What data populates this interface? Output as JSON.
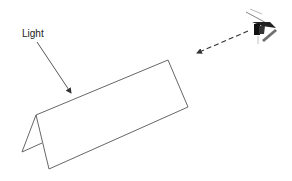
{
  "diagram": {
    "type": "illustration",
    "labels": {
      "light": "Light"
    },
    "elements": [
      {
        "name": "light-label",
        "text": "Light"
      },
      {
        "name": "light-arrow",
        "style": "solid",
        "direction": "toward card top face"
      },
      {
        "name": "folded-card",
        "shape": "tent-fold"
      },
      {
        "name": "view-arrow",
        "style": "dashed",
        "direction": "from eye toward card"
      },
      {
        "name": "eye-icon",
        "depicts": "side-view eye"
      }
    ],
    "colors": {
      "stroke": "#555555",
      "text": "#222222",
      "background": "#ffffff"
    }
  }
}
